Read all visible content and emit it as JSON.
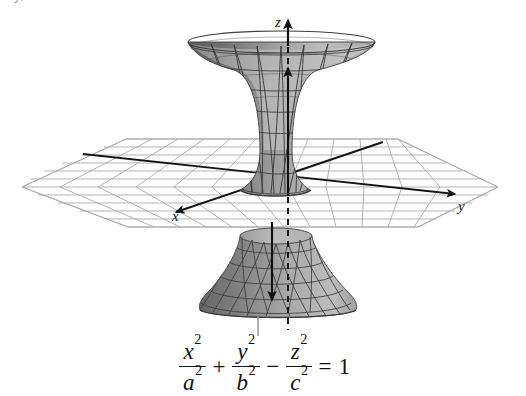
{
  "title": {
    "clipped_text": "y, z > 0 in all cases"
  },
  "figure": {
    "caption_equation": {
      "terms": [
        {
          "numerator": "x",
          "num_exponent": "2",
          "denominator": "a",
          "den_exponent": "2"
        },
        {
          "numerator": "y",
          "num_exponent": "2",
          "denominator": "b",
          "den_exponent": "2"
        },
        {
          "numerator": "z",
          "num_exponent": "2",
          "denominator": "c",
          "den_exponent": "2"
        }
      ],
      "operators": [
        "+",
        "−"
      ],
      "equals": "=",
      "right_hand_side": "1",
      "plain": "x^2/a^2 + y^2/b^2 - z^2/c^2 = 1"
    },
    "axes": [
      {
        "name": "x",
        "label": "x",
        "direction": "toward viewer, lower-left"
      },
      {
        "name": "y",
        "label": "y",
        "direction": "to the right"
      },
      {
        "name": "z",
        "label": "z",
        "direction": "upward"
      }
    ],
    "surface_name": "hyperboloid",
    "colors": {
      "surface_light": "#b6b6b6",
      "surface_dark": "#6f6f6f",
      "surface_mid": "#9a9a9a",
      "mesh_line": "#4a4a4a",
      "grid_line": "#9e9e9e",
      "axis_line": "#141414",
      "background": "#ffffff"
    }
  }
}
